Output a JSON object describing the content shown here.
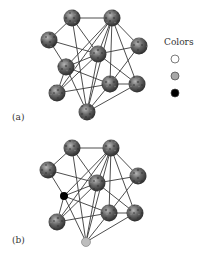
{
  "legend": {
    "title": "Colors",
    "items": [
      {
        "name": "white",
        "color": "#ffffff"
      },
      {
        "name": "gray",
        "color": "#a8a8a8"
      },
      {
        "name": "black",
        "color": "#000000"
      }
    ]
  },
  "panels": [
    {
      "label": "(a)",
      "nodes": [
        {
          "id": 1,
          "x": 72,
          "y": 18,
          "type": "globe"
        },
        {
          "id": 2,
          "x": 112,
          "y": 18,
          "type": "globe"
        },
        {
          "id": 3,
          "x": 49,
          "y": 40,
          "type": "globe"
        },
        {
          "id": 4,
          "x": 139,
          "y": 46,
          "type": "globe"
        },
        {
          "id": 5,
          "x": 98,
          "y": 54,
          "type": "globe"
        },
        {
          "id": 6,
          "x": 66,
          "y": 67,
          "type": "globe"
        },
        {
          "id": 7,
          "x": 110,
          "y": 84,
          "type": "globe"
        },
        {
          "id": 8,
          "x": 137,
          "y": 84,
          "type": "globe"
        },
        {
          "id": 9,
          "x": 57,
          "y": 93,
          "type": "globe"
        },
        {
          "id": 10,
          "x": 87,
          "y": 112,
          "type": "globe"
        }
      ]
    },
    {
      "label": "(b)",
      "nodes": [
        {
          "id": 1,
          "x": 72,
          "y": 148,
          "type": "globe"
        },
        {
          "id": 2,
          "x": 111,
          "y": 148,
          "type": "globe"
        },
        {
          "id": 3,
          "x": 48,
          "y": 170,
          "type": "globe"
        },
        {
          "id": 4,
          "x": 138,
          "y": 176,
          "type": "globe"
        },
        {
          "id": 5,
          "x": 97,
          "y": 183,
          "type": "globe"
        },
        {
          "id": 6,
          "x": 64,
          "y": 196,
          "type": "black"
        },
        {
          "id": 7,
          "x": 109,
          "y": 213,
          "type": "globe"
        },
        {
          "id": 8,
          "x": 135,
          "y": 213,
          "type": "globe"
        },
        {
          "id": 9,
          "x": 57,
          "y": 222,
          "type": "globe"
        },
        {
          "id": 10,
          "x": 86,
          "y": 242,
          "type": "gray"
        }
      ]
    }
  ],
  "edges": [
    [
      1,
      2
    ],
    [
      1,
      3
    ],
    [
      1,
      5
    ],
    [
      1,
      10
    ],
    [
      2,
      6
    ],
    [
      2,
      5
    ],
    [
      2,
      7
    ],
    [
      2,
      8
    ],
    [
      2,
      4
    ],
    [
      2,
      10
    ],
    [
      2,
      9
    ],
    [
      3,
      5
    ],
    [
      3,
      6
    ],
    [
      5,
      4
    ],
    [
      5,
      6
    ],
    [
      5,
      9
    ],
    [
      5,
      10
    ],
    [
      5,
      8
    ],
    [
      4,
      7
    ],
    [
      6,
      9
    ],
    [
      6,
      10
    ],
    [
      6,
      7
    ],
    [
      9,
      7
    ],
    [
      7,
      8
    ],
    [
      7,
      10
    ],
    [
      8,
      10
    ]
  ]
}
